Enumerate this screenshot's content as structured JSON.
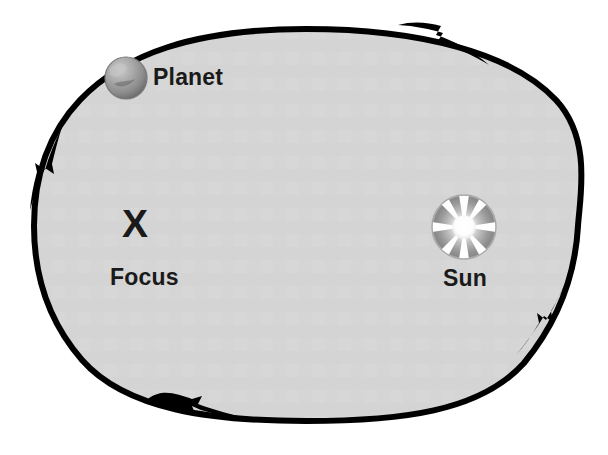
{
  "diagram": {
    "labels": {
      "planet": "Planet",
      "focus_mark": "X",
      "focus": "Focus",
      "sun": "Sun"
    },
    "colors": {
      "background": "#ffffff",
      "orbit_fill": "#d4d4d4",
      "orbit_stroke": "#000000",
      "text": "#1a1a1a",
      "planet_light": "#b9b9b9",
      "planet_dark": "#6f6f6f",
      "sun_rim_dark": "#8f8f8f",
      "sun_ray": "#ffffff"
    },
    "orbit": {
      "shape": "ellipse",
      "center": {
        "x": 306,
        "y": 225
      },
      "radius_x": 272,
      "radius_y": 196,
      "stroke_width": 6
    },
    "bodies": [
      {
        "name": "planet",
        "kind": "sphere",
        "label": "Planet",
        "center": {
          "x": 126,
          "y": 78
        },
        "radius": 21
      },
      {
        "name": "sun",
        "kind": "star-disc",
        "label": "Sun",
        "center": {
          "x": 464,
          "y": 227
        },
        "radius": 32,
        "ray_count": 8
      }
    ],
    "markers": [
      {
        "name": "focus",
        "kind": "x-mark",
        "label": "Focus",
        "center": {
          "x": 137,
          "y": 226
        }
      }
    ],
    "direction_arrows": [
      {
        "name": "arrow-top",
        "position": {
          "x": 438,
          "y": 38
        },
        "points": "clockwise-right"
      },
      {
        "name": "arrow-left",
        "position": {
          "x": 46,
          "y": 160
        },
        "points": "down"
      },
      {
        "name": "arrow-bottom",
        "position": {
          "x": 196,
          "y": 414
        },
        "points": "right"
      },
      {
        "name": "arrow-right",
        "position": {
          "x": 551,
          "y": 307
        },
        "points": "up"
      }
    ]
  }
}
